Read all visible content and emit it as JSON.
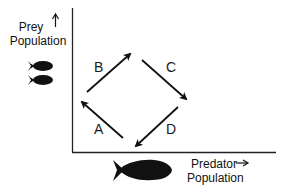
{
  "diagram": {
    "type": "predator-prey cycle",
    "y_axis": {
      "word1": "Prey",
      "word2": "Population",
      "arrow": "up-arrow"
    },
    "x_axis": {
      "word1": "Predator",
      "word2": "Population",
      "arrow": "right-arrow"
    },
    "phases": [
      {
        "label": "A",
        "direction": "up-left"
      },
      {
        "label": "B",
        "direction": "up-right"
      },
      {
        "label": "C",
        "direction": "down-right"
      },
      {
        "label": "D",
        "direction": "down-left"
      }
    ],
    "icons": {
      "prey": "small-fish-icon",
      "predator": "large-fish-icon"
    },
    "colors": {
      "ink": "#111111",
      "background": "#ffffff"
    }
  }
}
